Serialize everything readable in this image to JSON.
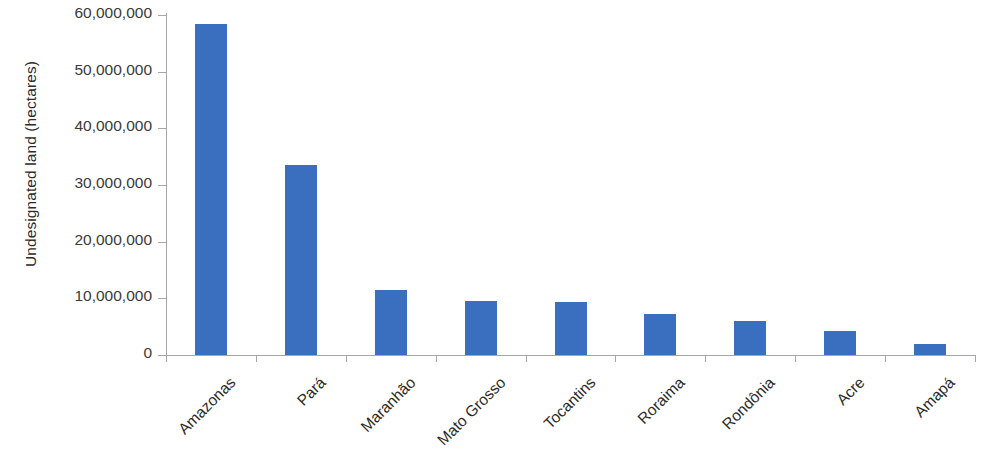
{
  "chart_data": {
    "type": "bar",
    "title": "",
    "subtitle": "",
    "xlabel": "",
    "ylabel": "Undesignated land (hectares)",
    "categories": [
      "Amazonas",
      "Pará",
      "Maranhão",
      "Mato Grosso",
      "Tocantins",
      "Roraima",
      "Rondônia",
      "Acre",
      "Amapá"
    ],
    "values": [
      58500000,
      33600000,
      11400000,
      9500000,
      9300000,
      7300000,
      6000000,
      4200000,
      2000000
    ],
    "ylim": [
      0,
      60000000
    ],
    "ytick_values": [
      0,
      10000000,
      20000000,
      30000000,
      40000000,
      50000000,
      60000000
    ],
    "ytick_labels": [
      "0",
      "10,000,000",
      "20,000,000",
      "30,000,000",
      "40,000,000",
      "50,000,000",
      "60,000,000"
    ],
    "grid": false,
    "legend": false,
    "legend_position": "none",
    "series": [
      {
        "name": "Undesignated land",
        "color": "#3a6fbf",
        "values": [
          58500000,
          33600000,
          11400000,
          9500000,
          9300000,
          7300000,
          6000000,
          4200000,
          2000000
        ]
      }
    ],
    "bar_color": "#3a6fbf",
    "axis_color": "#a6a6a6",
    "text_color": "#2b2b2b",
    "xlabel_rotation": -45
  }
}
